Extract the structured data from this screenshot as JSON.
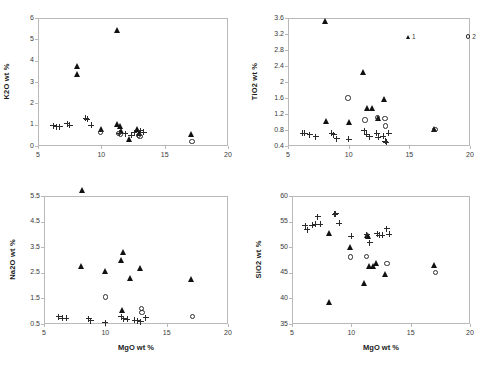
{
  "figure": {
    "background": "#ffffff",
    "marker_colors": {
      "filled": "#111111",
      "open": "#2b2b2b",
      "cross": "#2b2b2b"
    },
    "axis_color": "#b9b9b9"
  },
  "legend": {
    "items": [
      {
        "label": "1",
        "marker": "filled-triangle"
      },
      {
        "label": "2",
        "marker": "open-circle"
      },
      {
        "label": "3",
        "marker": "plus"
      }
    ]
  },
  "chart_data": [
    {
      "type": "scatter",
      "panel": "top-left",
      "title": "",
      "xlabel": "",
      "ylabel": "K2O wt %",
      "xlim": [
        5,
        20
      ],
      "ylim": [
        0,
        6
      ],
      "xticks": [
        5,
        10,
        15,
        20
      ],
      "yticks": [
        0,
        1,
        2,
        3,
        4,
        5,
        6
      ],
      "grid": false,
      "series": [
        {
          "name": "1",
          "marker": "filled-triangle",
          "points": [
            [
              8.1,
              3.75
            ],
            [
              8.15,
              3.35
            ],
            [
              11.3,
              5.45
            ],
            [
              10.0,
              0.78
            ],
            [
              11.25,
              1.05
            ],
            [
              11.55,
              0.95
            ],
            [
              11.6,
              0.72
            ],
            [
              12.2,
              0.32
            ],
            [
              12.9,
              0.8
            ],
            [
              13.05,
              0.62
            ],
            [
              17.1,
              0.57
            ]
          ]
        },
        {
          "name": "2",
          "marker": "open-circle",
          "points": [
            [
              9.95,
              0.62
            ],
            [
              11.35,
              0.6
            ],
            [
              11.5,
              0.55
            ],
            [
              12.95,
              0.5
            ],
            [
              13.05,
              0.45
            ],
            [
              17.15,
              0.2
            ]
          ]
        },
        {
          "name": "3",
          "marker": "plus",
          "points": [
            [
              6.2,
              0.95
            ],
            [
              6.45,
              0.9
            ],
            [
              6.7,
              0.9
            ],
            [
              7.3,
              1.05
            ],
            [
              7.5,
              0.98
            ],
            [
              8.75,
              1.3
            ],
            [
              8.9,
              1.25
            ],
            [
              9.2,
              0.98
            ],
            [
              11.4,
              0.6
            ],
            [
              11.9,
              0.58
            ],
            [
              12.35,
              0.5
            ],
            [
              12.6,
              0.62
            ],
            [
              13.1,
              0.72
            ],
            [
              13.35,
              0.65
            ]
          ]
        }
      ]
    },
    {
      "type": "scatter",
      "panel": "top-right",
      "title": "",
      "xlabel": "",
      "ylabel": "TiO2 wt %",
      "xlim": [
        5,
        20
      ],
      "ylim": [
        0.4,
        3.6
      ],
      "xticks": [
        5,
        10,
        15,
        20
      ],
      "yticks": [
        0.4,
        0.8,
        1.2,
        1.6,
        2.0,
        2.4,
        2.8,
        3.2,
        3.6
      ],
      "grid": false,
      "series": [
        {
          "name": "1",
          "marker": "filled-triangle",
          "points": [
            [
              8.1,
              3.52
            ],
            [
              8.15,
              1.02
            ],
            [
              10.05,
              1.0
            ],
            [
              11.2,
              2.26
            ],
            [
              11.6,
              1.36
            ],
            [
              11.95,
              1.35
            ],
            [
              12.95,
              1.58
            ],
            [
              12.5,
              1.1
            ],
            [
              17.05,
              0.83
            ]
          ]
        },
        {
          "name": "2",
          "marker": "open-circle",
          "points": [
            [
              9.95,
              1.6
            ],
            [
              11.35,
              1.05
            ],
            [
              12.4,
              1.12
            ],
            [
              13.0,
              1.08
            ],
            [
              13.05,
              0.9
            ],
            [
              17.1,
              0.82
            ]
          ]
        },
        {
          "name": "3",
          "marker": "plus",
          "points": [
            [
              6.2,
              0.72
            ],
            [
              6.4,
              0.72
            ],
            [
              6.8,
              0.68
            ],
            [
              7.3,
              0.63
            ],
            [
              8.6,
              0.72
            ],
            [
              8.75,
              0.68
            ],
            [
              9.0,
              0.58
            ],
            [
              10.0,
              0.57
            ],
            [
              11.3,
              0.78
            ],
            [
              11.5,
              0.7
            ],
            [
              11.75,
              0.63
            ],
            [
              12.3,
              0.72
            ],
            [
              12.45,
              0.62
            ],
            [
              12.85,
              0.65
            ],
            [
              13.0,
              0.52
            ],
            [
              13.1,
              0.5
            ],
            [
              13.3,
              0.72
            ]
          ]
        }
      ]
    },
    {
      "type": "scatter",
      "panel": "bottom-left",
      "title": "",
      "xlabel": "MgO wt %",
      "ylabel": "Na2O wt %",
      "xlim": [
        5,
        20
      ],
      "ylim": [
        0.5,
        5.5
      ],
      "xticks": [
        5,
        10,
        15,
        20
      ],
      "yticks": [
        0.5,
        1.5,
        2.5,
        3.5,
        4.5,
        5.5
      ],
      "grid": false,
      "series": [
        {
          "name": "1",
          "marker": "filled-triangle",
          "points": [
            [
              8.15,
              5.75
            ],
            [
              8.1,
              2.78
            ],
            [
              10.0,
              2.57
            ],
            [
              11.3,
              3.0
            ],
            [
              11.5,
              3.3
            ],
            [
              12.1,
              2.28
            ],
            [
              12.85,
              2.7
            ],
            [
              17.05,
              2.25
            ],
            [
              11.4,
              1.05
            ]
          ]
        },
        {
          "name": "2",
          "marker": "open-circle",
          "points": [
            [
              10.0,
              1.55
            ],
            [
              12.95,
              1.1
            ],
            [
              13.0,
              0.95
            ],
            [
              17.1,
              0.8
            ]
          ]
        },
        {
          "name": "3",
          "marker": "plus",
          "points": [
            [
              6.2,
              0.78
            ],
            [
              6.5,
              0.72
            ],
            [
              6.8,
              0.72
            ],
            [
              8.65,
              0.7
            ],
            [
              8.8,
              0.62
            ],
            [
              10.0,
              0.55
            ],
            [
              11.3,
              0.78
            ],
            [
              11.5,
              0.7
            ],
            [
              11.8,
              0.68
            ],
            [
              12.4,
              0.65
            ],
            [
              12.6,
              0.62
            ],
            [
              12.9,
              0.58
            ],
            [
              13.3,
              0.75
            ]
          ]
        }
      ]
    },
    {
      "type": "scatter",
      "panel": "bottom-right",
      "title": "",
      "xlabel": "MgO wt %",
      "ylabel": "SiO2 wt %",
      "xlim": [
        5,
        20
      ],
      "ylim": [
        35,
        60
      ],
      "xticks": [
        5,
        10,
        15,
        20
      ],
      "yticks": [
        35,
        40,
        45,
        50,
        55,
        60
      ],
      "grid": false,
      "series": [
        {
          "name": "1",
          "marker": "filled-triangle",
          "points": [
            [
              8.15,
              39.2
            ],
            [
              8.2,
              52.7
            ],
            [
              9.95,
              50.1
            ],
            [
              11.1,
              42.9
            ],
            [
              11.35,
              52.3
            ],
            [
              11.45,
              52.1
            ],
            [
              11.5,
              46.4
            ],
            [
              11.9,
              46.4
            ],
            [
              12.1,
              46.9
            ],
            [
              12.9,
              44.8
            ],
            [
              17.05,
              46.5
            ]
          ]
        },
        {
          "name": "2",
          "marker": "open-circle",
          "points": [
            [
              9.95,
              48.1
            ],
            [
              11.3,
              48.2
            ],
            [
              13.0,
              46.8
            ],
            [
              17.1,
              45.1
            ]
          ]
        },
        {
          "name": "3",
          "marker": "plus",
          "points": [
            [
              6.1,
              54.2
            ],
            [
              6.3,
              53.4
            ],
            [
              6.7,
              54.3
            ],
            [
              7.0,
              54.5
            ],
            [
              7.15,
              55.9
            ],
            [
              7.4,
              54.5
            ],
            [
              8.6,
              56.4
            ],
            [
              8.7,
              56.5
            ],
            [
              9.0,
              54.7
            ],
            [
              10.0,
              52.1
            ],
            [
              11.3,
              52.4
            ],
            [
              11.55,
              50.9
            ],
            [
              12.2,
              52.6
            ],
            [
              12.35,
              52.3
            ],
            [
              12.6,
              52.3
            ],
            [
              13.0,
              53.6
            ],
            [
              13.2,
              52.5
            ]
          ]
        }
      ]
    }
  ]
}
